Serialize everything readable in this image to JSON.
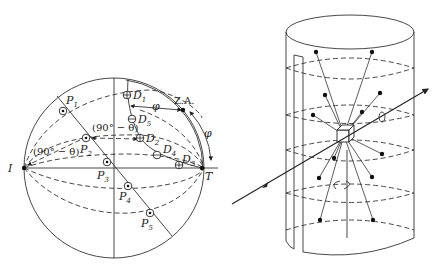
{
  "figure": {
    "left_panel": {
      "name": "stereographic-projection",
      "labels": {
        "I": "I",
        "T": "T",
        "ZA": "Z.A.",
        "phi_top": "φ",
        "phi_right": "φ",
        "angle1": "(90° − θ)",
        "angle2": "(90° − θ)"
      },
      "poles_P": [
        "P",
        "P",
        "P",
        "P",
        "P"
      ],
      "poles_P_sub": [
        "1",
        "2",
        "3",
        "4",
        "5"
      ],
      "poles_D": [
        "D",
        "D",
        "D",
        "D",
        "D"
      ],
      "poles_D_sub": [
        "1",
        "2",
        "3",
        "4",
        "5"
      ]
    },
    "right_panel": {
      "name": "cylindrical-camera-diffraction-cones",
      "description": "Crystal at center of cylindrical film with incident beam; diffracted rays lying on cones; rotation axis vertical"
    }
  }
}
